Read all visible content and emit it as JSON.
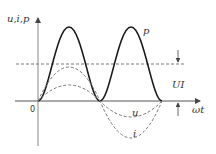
{
  "diagram": {
    "y_axis_label": "u,i,p",
    "x_axis_label": "ωt",
    "origin_label": "0",
    "curves": [
      {
        "name": "p",
        "label": "p",
        "style": "solid",
        "description": "instantaneous power, always non-negative, double frequency"
      },
      {
        "name": "u",
        "label": "u",
        "style": "dashed",
        "description": "voltage sinusoid"
      },
      {
        "name": "i",
        "label": "i",
        "style": "dashed",
        "description": "current sinusoid, larger amplitude"
      }
    ],
    "average_line": {
      "label": "UI",
      "style": "dashed",
      "description": "average power level"
    },
    "colors": {
      "curve": "#1a1a1a",
      "dashed": "#777777",
      "axis": "#555555"
    }
  }
}
